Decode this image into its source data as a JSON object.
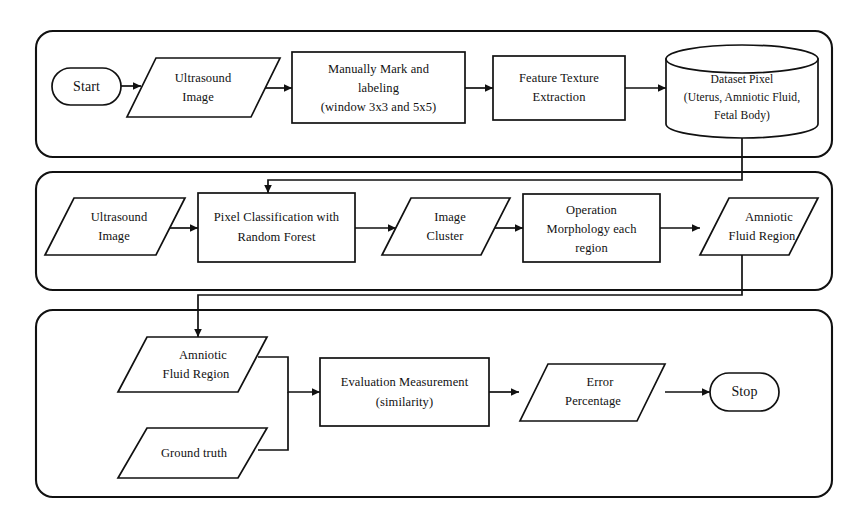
{
  "diagram": {
    "stroke_color": "#111111",
    "background_color": "#ffffff",
    "phases": [
      {
        "id": "phase-1",
        "name": "training-phase",
        "nodes": [
          {
            "id": "start",
            "shape": "terminal",
            "lines": [
              "Start"
            ]
          },
          {
            "id": "ultrasound-1",
            "shape": "parallelogram",
            "lines": [
              "Ultrasound",
              "Image"
            ]
          },
          {
            "id": "manual-mark",
            "shape": "process",
            "lines": [
              "Manually Mark and",
              "labeling",
              "(window 3x3 and 5x5)"
            ]
          },
          {
            "id": "feature-texture",
            "shape": "process",
            "lines": [
              "Feature  Texture",
              "Extraction"
            ]
          },
          {
            "id": "dataset-pixel",
            "shape": "database",
            "lines": [
              "Dataset Pixel",
              "(Uterus, Amniotic Fluid,",
              "Fetal Body)"
            ]
          }
        ]
      },
      {
        "id": "phase-2",
        "name": "classification-phase",
        "nodes": [
          {
            "id": "ultrasound-2",
            "shape": "parallelogram",
            "lines": [
              "Ultrasound",
              "Image"
            ]
          },
          {
            "id": "pixel-classify",
            "shape": "process",
            "lines": [
              "Pixel Classification with",
              "Random Forest"
            ]
          },
          {
            "id": "image-cluster",
            "shape": "parallelogram",
            "lines": [
              "Image",
              "Cluster"
            ]
          },
          {
            "id": "morphology",
            "shape": "process",
            "lines": [
              "Operation",
              "Morphology each",
              "region"
            ]
          },
          {
            "id": "amniotic-1",
            "shape": "parallelogram",
            "lines": [
              "Amniotic",
              "Fluid Region"
            ]
          }
        ]
      },
      {
        "id": "phase-3",
        "name": "evaluation-phase",
        "nodes": [
          {
            "id": "amniotic-2",
            "shape": "parallelogram",
            "lines": [
              "Amniotic",
              "Fluid Region"
            ]
          },
          {
            "id": "ground-truth",
            "shape": "parallelogram",
            "lines": [
              "Ground truth"
            ]
          },
          {
            "id": "evaluation",
            "shape": "process",
            "lines": [
              "Evaluation Measurement",
              "(similarity)"
            ]
          },
          {
            "id": "error-pct",
            "shape": "parallelogram",
            "lines": [
              "Error",
              "Percentage"
            ]
          },
          {
            "id": "stop",
            "shape": "terminal",
            "lines": [
              "Stop"
            ]
          }
        ]
      }
    ],
    "connectors": [
      {
        "id": "c1",
        "from": "start",
        "to": "ultrasound-1",
        "arrow": true
      },
      {
        "id": "c2",
        "from": "ultrasound-1",
        "to": "manual-mark",
        "arrow": true
      },
      {
        "id": "c3",
        "from": "manual-mark",
        "to": "feature-texture",
        "arrow": true
      },
      {
        "id": "c4",
        "from": "feature-texture",
        "to": "dataset-pixel",
        "arrow": true
      },
      {
        "id": "c5",
        "from": "dataset-pixel",
        "to": "pixel-classify",
        "arrow": true
      },
      {
        "id": "c6",
        "from": "ultrasound-2",
        "to": "pixel-classify",
        "arrow": true
      },
      {
        "id": "c7",
        "from": "pixel-classify",
        "to": "image-cluster",
        "arrow": true
      },
      {
        "id": "c8",
        "from": "image-cluster",
        "to": "morphology",
        "arrow": true
      },
      {
        "id": "c9",
        "from": "morphology",
        "to": "amniotic-1",
        "arrow": true
      },
      {
        "id": "c10",
        "from": "amniotic-1",
        "to": "amniotic-2",
        "arrow": true
      },
      {
        "id": "c11",
        "from": "amniotic-2",
        "to": "evaluation",
        "arrow": true
      },
      {
        "id": "c12",
        "from": "ground-truth",
        "to": "evaluation",
        "arrow": false
      },
      {
        "id": "c13",
        "from": "evaluation",
        "to": "error-pct",
        "arrow": true
      },
      {
        "id": "c14",
        "from": "error-pct",
        "to": "stop",
        "arrow": true
      }
    ]
  }
}
